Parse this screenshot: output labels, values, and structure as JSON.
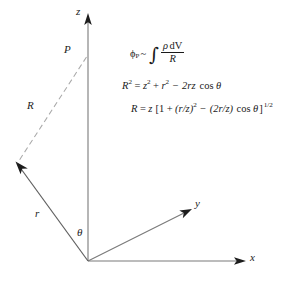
{
  "figure": {
    "type": "geometry-diagram",
    "background_color": "#ffffff",
    "line_color": "#6e6e6e",
    "dashed_line_color": "#a8a8a8",
    "text_color": "#1a1a1a"
  },
  "axes": [
    {
      "id": "z",
      "label": "z",
      "label_x": 76,
      "label_y": 7
    },
    {
      "id": "y",
      "label": "y",
      "label_x": 195,
      "label_y": 198
    },
    {
      "id": "x",
      "label": "x",
      "label_x": 250,
      "label_y": 251
    }
  ],
  "points": [
    {
      "id": "P",
      "label": "P",
      "label_x": 64,
      "label_y": 44
    }
  ],
  "vectors": [
    {
      "id": "R",
      "label": "R",
      "label_x": 28,
      "label_y": 100,
      "style": "dashed"
    },
    {
      "id": "r",
      "label": "r",
      "label_x": 35,
      "label_y": 208,
      "style": "solid-arrow"
    }
  ],
  "angles": [
    {
      "id": "theta",
      "label": "θ",
      "label_x": 77,
      "label_y": 226
    }
  ],
  "equations": {
    "eq1": {
      "id": "potential-integral",
      "lhs_symbol": "ϕ",
      "lhs_subscript": "P",
      "relation": "~",
      "integral": "∫",
      "numerator_rho": "ρ",
      "numerator_dv": "dV",
      "denominator": "R",
      "plain": "ϕ_P ~ ∫ ρ dV / R"
    },
    "eq2": {
      "id": "law-of-cosines",
      "lhs": "R",
      "lhs_sup": "2",
      "eq": "=",
      "t1": "z",
      "t1_sup": "2",
      "op1": "+",
      "t2": "r",
      "t2_sup": "2",
      "op2": "−",
      "t3": "2rz",
      "cos": "cos",
      "theta": "θ",
      "plain": "R² = z² + r² − 2rz cos θ"
    },
    "eq3": {
      "id": "expanded-R",
      "lhs": "R",
      "eq": "=",
      "z": "z",
      "bracket_open": "[",
      "one": "1",
      "op1": "+",
      "term1": "(r/z)",
      "term1_sup": "2",
      "op2": "−",
      "term2": "(2r/z)",
      "cos": "cos",
      "theta": "θ",
      "bracket_close": "]",
      "exp": "1/2",
      "plain": "R = z [1 + (r/z)² − (2r/z) cos θ]^(1/2)"
    }
  }
}
